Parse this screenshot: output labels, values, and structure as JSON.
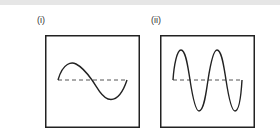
{
  "panels": [
    {
      "label": "(i)",
      "description": "sine wave, 1 cycle, small amplitude",
      "cycles": 1,
      "amplitude": "small"
    },
    {
      "label": "(ii)",
      "description": "sine wave, 2 cycles, large amplitude",
      "cycles": 2,
      "amplitude": "large"
    }
  ],
  "colors": {
    "stroke": "#222222",
    "dash": "#555555",
    "background": "#ffffff"
  }
}
